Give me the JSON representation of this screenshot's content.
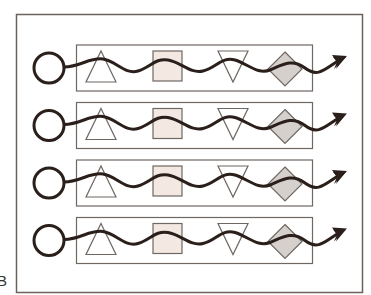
{
  "figure": {
    "panel_label": "B",
    "colors": {
      "frame": "#6b625c",
      "row_box": "#6f6761",
      "wave": "#2a1f1a",
      "square_fill": "#f3e9e2",
      "diamond_fill": "#d5d0cc",
      "triangle_fill": "#ffffff",
      "circle_stroke": "#2a1f1a"
    },
    "rows": [
      {
        "id": 1,
        "shapes": [
          "circle",
          "triangle-up",
          "square",
          "triangle-down",
          "diamond",
          "arrow"
        ]
      },
      {
        "id": 2,
        "shapes": [
          "circle",
          "triangle-up",
          "square",
          "triangle-down",
          "diamond",
          "arrow"
        ]
      },
      {
        "id": 3,
        "shapes": [
          "circle",
          "triangle-up",
          "square",
          "triangle-down",
          "diamond",
          "arrow"
        ]
      },
      {
        "id": 4,
        "shapes": [
          "circle",
          "triangle-up",
          "square",
          "triangle-down",
          "diamond",
          "arrow"
        ]
      }
    ]
  }
}
